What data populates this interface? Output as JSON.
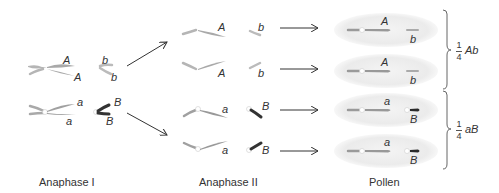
{
  "stages": {
    "anaphase1": "Anaphase I",
    "anaphase2": "Anaphase II",
    "pollen": "Pollen"
  },
  "anaphase1": {
    "top": {
      "large": [
        "A",
        "A"
      ],
      "small": [
        "b",
        "b"
      ]
    },
    "bottom": {
      "large": [
        "a",
        "a"
      ],
      "small": [
        "B",
        "B"
      ]
    }
  },
  "anaphase2": [
    {
      "large": "A",
      "small": "b"
    },
    {
      "large": "A",
      "small": "b"
    },
    {
      "large": "a",
      "small": "B"
    },
    {
      "large": "a",
      "small": "B"
    }
  ],
  "pollen": [
    {
      "large": "A",
      "small": "b"
    },
    {
      "large": "A",
      "small": "b"
    },
    {
      "large": "a",
      "small": "B"
    },
    {
      "large": "a",
      "small": "B"
    }
  ],
  "ratios": [
    {
      "numerator": "1",
      "denominator": "4",
      "genotype": "Ab"
    },
    {
      "numerator": "1",
      "denominator": "4",
      "genotype": "aB"
    }
  ],
  "colors": {
    "chromosome_light": "#a9a9a9",
    "chromosome_dark": "#2a2a2a",
    "pollen_fill": "#ececec",
    "arrow": "#333333"
  }
}
